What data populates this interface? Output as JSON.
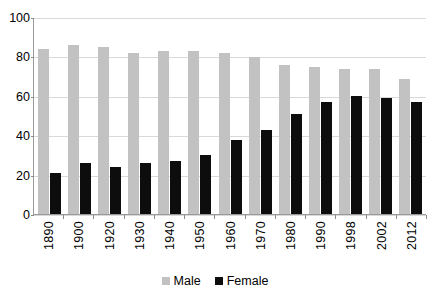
{
  "chart_data": {
    "type": "bar",
    "title": "",
    "subtitle": "",
    "xlabel": "",
    "ylabel": "",
    "ylim": [
      0,
      100
    ],
    "yticks": [
      0,
      20,
      40,
      60,
      80,
      100
    ],
    "grid": true,
    "legend_position": "bottom",
    "categories": [
      "1890",
      "1900",
      "1920",
      "1930",
      "1940",
      "1950",
      "1960",
      "1970",
      "1980",
      "1990",
      "1998",
      "2002",
      "2012"
    ],
    "series": [
      {
        "name": "Male",
        "color": "#c2c2c2",
        "values": [
          84,
          86,
          85,
          82,
          83,
          83,
          82,
          80,
          76,
          75,
          74,
          74,
          69
        ]
      },
      {
        "name": "Female",
        "color": "#0d0d0d",
        "values": [
          21,
          26,
          24,
          26,
          27,
          30,
          38,
          43,
          51,
          57,
          60,
          59,
          57
        ]
      }
    ]
  },
  "legend": {
    "items": [
      {
        "label": "Male",
        "swatch": "male"
      },
      {
        "label": "Female",
        "swatch": "female"
      }
    ]
  }
}
